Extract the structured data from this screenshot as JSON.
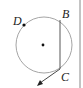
{
  "diagram": {
    "type": "circle-geometry",
    "circle": {
      "cx": 44,
      "cy": 45,
      "r": 28,
      "stroke": "#9a9a9a"
    },
    "center_point": {
      "x": 43,
      "y": 45
    },
    "points": [
      {
        "id": "D",
        "label": "D",
        "x": 24,
        "y": 25,
        "label_x": 13,
        "label_y": 25
      },
      {
        "id": "B",
        "label": "B",
        "x": 60,
        "y": 20,
        "label_x": 62,
        "label_y": 18
      },
      {
        "id": "C",
        "label": "C",
        "x": 60,
        "y": 69,
        "label_x": 61,
        "label_y": 81
      }
    ],
    "chord": {
      "from": "B",
      "to": "C"
    },
    "ray": {
      "from": "C",
      "to_x": 38,
      "to_y": 85
    },
    "border_color": "#888888"
  }
}
